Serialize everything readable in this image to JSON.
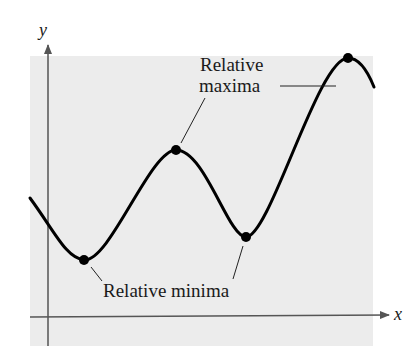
{
  "figure": {
    "background_color": "#ffffff",
    "panel_color": "#ececec",
    "curve_color": "#000000",
    "axis_color": "#555555",
    "axes": {
      "x_label": "x",
      "y_label": "y"
    },
    "annotations": {
      "maxima_line1": "Relative",
      "maxima_line2": "maxima",
      "minima": "Relative minima"
    },
    "points": [
      {
        "type": "relative-minimum",
        "x": 84,
        "y": 260
      },
      {
        "type": "relative-maximum",
        "x": 176,
        "y": 150
      },
      {
        "type": "relative-minimum",
        "x": 246,
        "y": 237
      },
      {
        "type": "relative-maximum",
        "x": 348,
        "y": 58
      }
    ]
  }
}
